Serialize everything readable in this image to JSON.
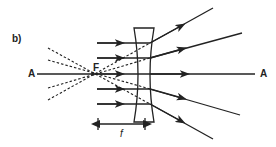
{
  "diagram": {
    "panel_label": "b)",
    "axis_label_left": "A",
    "axis_label_right": "A",
    "focal_point_label": "F",
    "focal_length_label": "f",
    "colors": {
      "line": "#222222",
      "background": "#ffffff"
    }
  }
}
